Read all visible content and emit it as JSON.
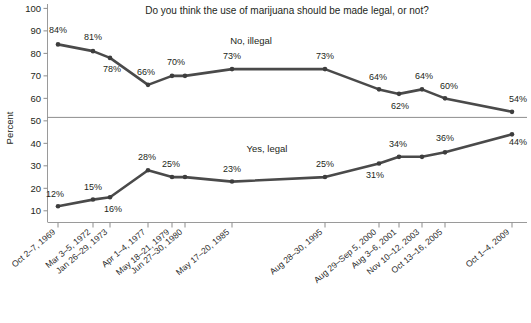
{
  "chart_data": {
    "type": "line",
    "title": "Do you think the use of marijuana should be made legal, or not?",
    "xlabel": "",
    "ylabel": "Percent",
    "ylim": [
      0,
      100
    ],
    "yticks": [
      10,
      20,
      30,
      40,
      50,
      60,
      70,
      80,
      90,
      100
    ],
    "grid": false,
    "reference_line": 50,
    "legend_position": "inline-annotations",
    "categories": [
      "Oct 2–7, 1969",
      "Mar 3–5, 1972",
      "Jan 26–29, 1973",
      "Apr 1–4, 1977",
      "May 18–21, 1979",
      "Jun 27–30, 1980",
      "May 17–20, 1985",
      "Aug 28–30, 1995",
      "Aug 29–Sep 5, 2000",
      "Aug 3–6, 2001",
      "Nov 10–12, 2003",
      "Oct 13–16, 2005",
      "Oct 1–4, 2009"
    ],
    "series": [
      {
        "name": "No, illegal",
        "values": [
          84,
          81,
          78,
          66,
          70,
          70,
          73,
          73,
          64,
          62,
          64,
          60,
          54
        ],
        "label_text": "No, illegal"
      },
      {
        "name": "Yes, legal",
        "values": [
          12,
          15,
          16,
          28,
          25,
          25,
          23,
          25,
          31,
          34,
          34,
          36,
          44
        ],
        "label_text": "Yes, legal"
      }
    ],
    "point_labels_illegal": [
      "84%",
      "81%",
      "78%",
      "66%",
      "70%",
      "",
      "73%",
      "73%",
      "64%",
      "62%",
      "64%",
      "60%",
      "54%"
    ],
    "point_labels_legal": [
      "12%",
      "15%",
      "16%",
      "28%",
      "25%",
      "",
      "23%",
      "25%",
      "31%",
      "34%",
      "",
      "36%",
      "44%"
    ],
    "colors": {
      "line": "#4a4a4a",
      "marker": "#3d3d3d",
      "axis": "#9a9a9a",
      "text": "#231f20",
      "background": "#ffffff"
    }
  },
  "footer": {
    "source_note": ""
  }
}
